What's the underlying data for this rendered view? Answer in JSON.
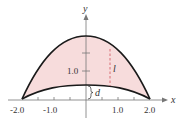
{
  "diagram": {
    "axes": {
      "x_label": "x",
      "y_label": "y",
      "x_ticks": [
        {
          "value": -2.0,
          "label": "-2.0"
        },
        {
          "value": -1.0,
          "label": "-1.0"
        },
        {
          "value": 1.0,
          "label": "1.0"
        },
        {
          "value": 2.0,
          "label": "2.0"
        }
      ],
      "y_ticks": [
        {
          "value": 1.0,
          "label": "1.0"
        }
      ]
    },
    "annotations": {
      "length_label": "l",
      "distance_label": "d"
    },
    "colors": {
      "fill": "#f7dcdc",
      "curve": "#1a1a1a",
      "dashed": "#d0505a",
      "axis": "#777777"
    }
  }
}
